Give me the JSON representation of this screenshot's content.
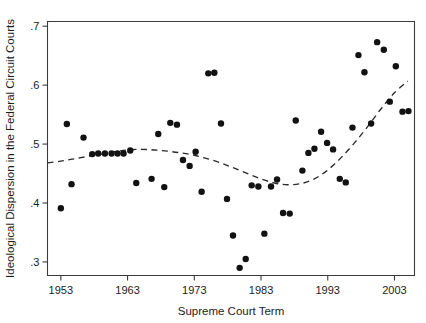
{
  "chart_data": {
    "type": "scatter",
    "title": "",
    "xlabel": "Supreme Court Term",
    "ylabel": "Ideological Dispersion in the Federal Circuit Courts",
    "xlim": [
      1951,
      2006
    ],
    "ylim": [
      0.277,
      0.708
    ],
    "xticks": [
      1953,
      1963,
      1973,
      1983,
      1993,
      2003
    ],
    "xtick_labels": [
      "1953",
      "1963",
      "1973",
      "1983",
      "1993",
      "2003"
    ],
    "yticks": [
      0.3,
      0.4,
      0.5,
      0.6,
      0.7
    ],
    "ytick_labels": [
      ".3",
      ".4",
      ".5",
      ".6",
      ".7"
    ],
    "grid": false,
    "legend": false,
    "marker": "filled-circle",
    "marker_color": "#121212",
    "x": [
      1953,
      1953.9,
      1954.6,
      1956.4,
      1957.7,
      1958.6,
      1959.6,
      1960.6,
      1961.5,
      1962.4,
      1963.4,
      1964.3,
      1966.6,
      1967.6,
      1968.5,
      1969.4,
      1970.4,
      1971.3,
      1972.3,
      1973.2,
      1974.1,
      1975.1,
      1976.0,
      1977.0,
      1977.9,
      1978.8,
      1979.8,
      1980.7,
      1981.6,
      1982.6,
      1983.5,
      1984.5,
      1985.4,
      1986.3,
      1987.3,
      1988.2,
      1989.2,
      1990.1,
      1991.0,
      1992.0,
      1992.9,
      1993.8,
      1994.8,
      1995.7,
      1996.7,
      1997.6,
      1998.5,
      1999.5,
      2000.4,
      2001.4,
      2002.3,
      2003.2,
      2004.2,
      2005.1
    ],
    "y": [
      0.391,
      0.534,
      0.432,
      0.511,
      0.483,
      0.484,
      0.484,
      0.484,
      0.484,
      0.484,
      0.489,
      0.434,
      0.441,
      0.517,
      0.427,
      0.536,
      0.533,
      0.473,
      0.463,
      0.487,
      0.419,
      0.62,
      0.621,
      0.535,
      0.407,
      0.345,
      0.29,
      0.305,
      0.43,
      0.428,
      0.348,
      0.428,
      0.44,
      0.383,
      0.382,
      0.54,
      0.455,
      0.485,
      0.492,
      0.521,
      0.502,
      0.491,
      0.441,
      0.435,
      0.528,
      0.651,
      0.622,
      0.535,
      0.673,
      0.66,
      0.572,
      0.632,
      0.555,
      0.556
    ],
    "trend": {
      "style": "dashed",
      "label": "lowess-smoother",
      "x": [
        1951.0,
        1953.0,
        1955.0,
        1957.0,
        1959.0,
        1961.0,
        1963.0,
        1965.0,
        1967.0,
        1969.0,
        1971.0,
        1973.0,
        1975.0,
        1977.0,
        1979.0,
        1981.0,
        1983.0,
        1985.0,
        1987.0,
        1989.0,
        1991.0,
        1993.0,
        1995.0,
        1997.0,
        1999.0,
        2001.0,
        2003.0,
        2005.0
      ],
      "y": [
        0.468,
        0.471,
        0.475,
        0.479,
        0.483,
        0.487,
        0.49,
        0.491,
        0.49,
        0.488,
        0.485,
        0.481,
        0.475,
        0.468,
        0.459,
        0.45,
        0.441,
        0.434,
        0.431,
        0.433,
        0.441,
        0.456,
        0.477,
        0.502,
        0.53,
        0.56,
        0.587,
        0.607
      ]
    }
  },
  "axes": {
    "x_axis_name": "x-axis",
    "y_axis_name": "y-axis"
  }
}
